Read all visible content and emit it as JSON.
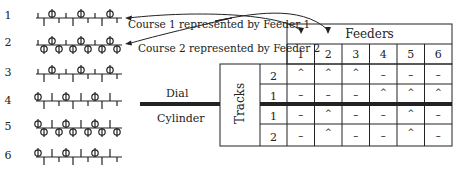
{
  "courses": [
    {
      "num": "1",
      "pattern": "dial-3-single"
    },
    {
      "num": "2",
      "pattern": "dial-3-cyl-6"
    },
    {
      "num": "3",
      "pattern": "dial-3-single"
    },
    {
      "num": "4",
      "pattern": "cyl-3-single"
    },
    {
      "num": "5",
      "pattern": "cyl-3-dial-6"
    },
    {
      "num": "6",
      "pattern": "cyl-3-single"
    }
  ],
  "annotations": {
    "course1": "Course 1 represented by Feeder 1",
    "course2": "Course 2 represented by Feeder 2"
  },
  "beds": {
    "dial": "Dial",
    "cylinder": "Cylinder"
  },
  "table": {
    "header": "Feeders",
    "tracks_label": "Tracks",
    "feeders": [
      "1",
      "2",
      "3",
      "4",
      "5",
      "6"
    ],
    "rows": [
      {
        "bed": "dial",
        "track": "2",
        "cells": [
          "^",
          "^",
          "^",
          "–",
          "–",
          "–"
        ]
      },
      {
        "bed": "dial",
        "track": "1",
        "cells": [
          "–",
          "–",
          "–",
          "^",
          "^",
          "^"
        ]
      },
      {
        "bed": "cylinder",
        "track": "1",
        "cells": [
          "–",
          "^",
          "–",
          "–",
          "^",
          "–"
        ]
      },
      {
        "bed": "cylinder",
        "track": "2",
        "cells": [
          "–",
          "^",
          "–",
          "–",
          "^",
          "–"
        ]
      }
    ]
  },
  "colors": {
    "line": "#222222",
    "background": "#ffffff"
  }
}
